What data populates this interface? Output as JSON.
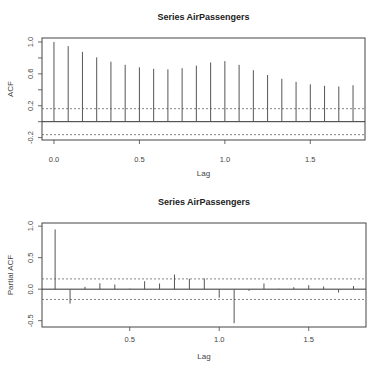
{
  "chart_data": [
    {
      "type": "bar",
      "subtype": "acf-stem",
      "title": "Series  AirPassengers",
      "xlabel": "Lag",
      "ylabel": "ACF",
      "xlim": [
        -0.07,
        1.82
      ],
      "ylim": [
        -0.23,
        1.05
      ],
      "xticks": [
        0.0,
        0.5,
        1.0,
        1.5
      ],
      "xtick_labels": [
        "0.0",
        "0.5",
        "1.0",
        "1.5"
      ],
      "yticks": [
        -0.2,
        0.0,
        0.2,
        0.4,
        0.6,
        0.8,
        1.0
      ],
      "ytick_labels": [
        "-0.2",
        "",
        "0.2",
        "",
        "0.6",
        "",
        "1.0"
      ],
      "ci": 0.163,
      "grid": false,
      "lags": [
        0.0,
        0.0833,
        0.1667,
        0.25,
        0.3333,
        0.4167,
        0.5,
        0.5833,
        0.6667,
        0.75,
        0.8333,
        0.9167,
        1.0,
        1.0833,
        1.1667,
        1.25,
        1.3333,
        1.4167,
        1.5,
        1.5833,
        1.6667,
        1.75
      ],
      "values": [
        1.0,
        0.948,
        0.876,
        0.807,
        0.753,
        0.714,
        0.682,
        0.663,
        0.656,
        0.671,
        0.703,
        0.743,
        0.76,
        0.713,
        0.646,
        0.586,
        0.538,
        0.5,
        0.469,
        0.45,
        0.442,
        0.457
      ]
    },
    {
      "type": "bar",
      "subtype": "pacf-stem",
      "title": "Series  AirPassengers",
      "xlabel": "Lag",
      "ylabel": "Partial ACF",
      "xlim": [
        0.01,
        1.82
      ],
      "ylim": [
        -0.6,
        1.05
      ],
      "xticks": [
        0.5,
        1.0,
        1.5
      ],
      "xtick_labels": [
        "0.5",
        "1.0",
        "1.5"
      ],
      "yticks": [
        -0.5,
        0.0,
        0.5,
        1.0
      ],
      "ytick_labels": [
        "-0.5",
        "0.0",
        "0.5",
        "1.0"
      ],
      "ci": 0.163,
      "grid": false,
      "lags": [
        0.0833,
        0.1667,
        0.25,
        0.3333,
        0.4167,
        0.5,
        0.5833,
        0.6667,
        0.75,
        0.8333,
        0.9167,
        1.0,
        1.0833,
        1.1667,
        1.25,
        1.3333,
        1.4167,
        1.5,
        1.5833,
        1.6667,
        1.75
      ],
      "values": [
        0.948,
        -0.229,
        0.038,
        0.094,
        0.074,
        0.008,
        0.126,
        0.09,
        0.232,
        0.166,
        0.171,
        -0.135,
        -0.54,
        -0.027,
        0.091,
        0.007,
        0.031,
        0.063,
        0.043,
        -0.053,
        0.05
      ]
    }
  ],
  "layout": {
    "panels": [
      {
        "box": [
          42,
          38,
          365,
          140
        ],
        "title_y": 20,
        "xlabel_y": 176,
        "ylabel_x": 13,
        "tick_label_y": 162
      },
      {
        "box": [
          42,
          223,
          366,
          327
        ],
        "title_y": 205,
        "xlabel_y": 359,
        "ylabel_x": 13,
        "tick_label_y": 342
      }
    ],
    "colors": {
      "stem": "#555555",
      "axis": "#444444",
      "ci": "#666666",
      "zero": "#333333"
    }
  }
}
